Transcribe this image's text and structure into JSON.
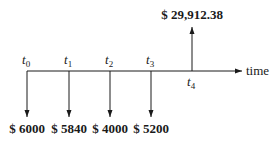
{
  "diagram": {
    "type": "cash-flow timeline",
    "axis_label": "time",
    "time_points": [
      {
        "label": "t",
        "sub": "0",
        "x": 27
      },
      {
        "label": "t",
        "sub": "1",
        "x": 69
      },
      {
        "label": "t",
        "sub": "2",
        "x": 110
      },
      {
        "label": "t",
        "sub": "3",
        "x": 151
      },
      {
        "label": "t",
        "sub": "4",
        "x": 192
      }
    ],
    "cash_flows": [
      {
        "time": "t0",
        "direction": "down",
        "amount": "$ 6000"
      },
      {
        "time": "t1",
        "direction": "down",
        "amount": "$ 5840"
      },
      {
        "time": "t2",
        "direction": "down",
        "amount": "$ 4000"
      },
      {
        "time": "t3",
        "direction": "down",
        "amount": "$ 5200"
      },
      {
        "time": "t4",
        "direction": "up",
        "amount": "$ 29,912.38"
      }
    ],
    "colors": {
      "line": "#1a1a1a",
      "background": "#ffffff"
    }
  }
}
